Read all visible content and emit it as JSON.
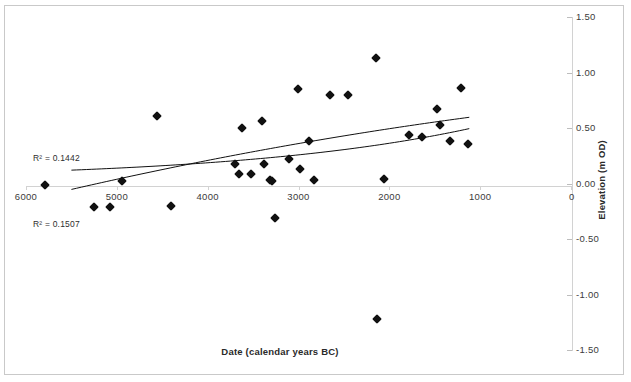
{
  "chart_data": {
    "type": "scatter",
    "title": "",
    "xlabel": "Date (calendar years BC)",
    "ylabel": "Elevation (m OD)",
    "xlim": [
      6000,
      0
    ],
    "ylim": [
      -1.5,
      1.5
    ],
    "x_ticks": [
      6000,
      5000,
      4000,
      3000,
      2000,
      1000,
      0
    ],
    "x_tick_labels": [
      "6000",
      "5000",
      "4000",
      "3000",
      "2000",
      "1000",
      "0"
    ],
    "y_ticks": [
      1.5,
      1.0,
      0.5,
      0.0,
      -0.5,
      -1.0,
      -1.5
    ],
    "y_tick_labels": [
      "1.50",
      "1.00",
      "0.50",
      "0.00",
      "-0.50",
      "-1.00",
      "-1.50"
    ],
    "grid": false,
    "legend": "none",
    "marker": "filled-diamond",
    "marker_color": "#111111",
    "axis_color": "#d2d2d2",
    "points": [
      {
        "x": 5790,
        "y": -0.01
      },
      {
        "x": 5250,
        "y": -0.21
      },
      {
        "x": 5080,
        "y": -0.21
      },
      {
        "x": 4940,
        "y": 0.02
      },
      {
        "x": 4560,
        "y": 0.61
      },
      {
        "x": 4400,
        "y": -0.2
      },
      {
        "x": 3700,
        "y": 0.18
      },
      {
        "x": 3660,
        "y": 0.09
      },
      {
        "x": 3620,
        "y": 0.5
      },
      {
        "x": 3520,
        "y": 0.09
      },
      {
        "x": 3400,
        "y": 0.56
      },
      {
        "x": 3380,
        "y": 0.18
      },
      {
        "x": 3310,
        "y": 0.03
      },
      {
        "x": 3290,
        "y": 0.02
      },
      {
        "x": 3260,
        "y": -0.31
      },
      {
        "x": 3100,
        "y": 0.22
      },
      {
        "x": 3010,
        "y": 0.85
      },
      {
        "x": 2980,
        "y": 0.13
      },
      {
        "x": 2880,
        "y": 0.38
      },
      {
        "x": 2830,
        "y": 0.03
      },
      {
        "x": 2650,
        "y": 0.8
      },
      {
        "x": 2450,
        "y": 0.8
      },
      {
        "x": 2150,
        "y": 1.13
      },
      {
        "x": 2140,
        "y": -1.22
      },
      {
        "x": 2060,
        "y": 0.04
      },
      {
        "x": 1780,
        "y": 0.44
      },
      {
        "x": 1640,
        "y": 0.42
      },
      {
        "x": 1480,
        "y": 0.67
      },
      {
        "x": 1440,
        "y": 0.53
      },
      {
        "x": 1330,
        "y": 0.38
      },
      {
        "x": 1210,
        "y": 0.86
      },
      {
        "x": 1130,
        "y": 0.36
      }
    ],
    "trendlines": [
      {
        "name": "upper-trend",
        "r_squared_label": "R² = 0.1442",
        "r_squared": 0.1442,
        "color": "#111111"
      },
      {
        "name": "lower-trend",
        "r_squared_label": "R² = 0.1507",
        "r_squared": 0.1507,
        "color": "#111111"
      }
    ]
  },
  "annotations": {
    "r2_top": "R² = 0.1442",
    "r2_bottom": "R² = 0.1507"
  }
}
